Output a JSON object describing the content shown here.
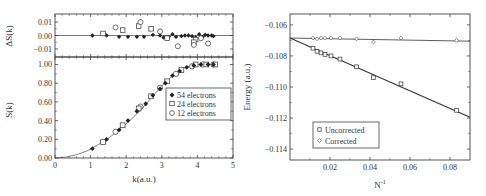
{
  "chart_data": [
    {
      "id": "left",
      "type": "scatter",
      "panels": [
        {
          "id": "delta",
          "ylabel": "ΔS(k)",
          "ylim": [
            -0.016,
            0.016
          ],
          "yticks": [
            0.01,
            0.0,
            -0.01
          ],
          "ytick_labels": [
            "0.01",
            "0.00",
            "-0.01"
          ],
          "reference_line": 0.0,
          "series": [
            {
              "name": "54 electrons",
              "marker": "filled-diamond",
              "x": [
                1.05,
                1.45,
                1.8,
                2.05,
                2.3,
                2.5,
                2.75,
                2.95,
                3.05,
                3.2,
                3.3,
                3.4,
                3.55,
                3.65,
                3.75,
                3.85,
                3.95,
                4.05,
                4.15,
                4.22,
                4.3,
                4.4,
                4.45
              ],
              "y": [
                0.0,
                0.0,
                -0.001,
                -0.001,
                -0.001,
                -0.001,
                0.0005,
                0.0,
                -0.0015,
                -0.001,
                0.001,
                -0.001,
                -0.0005,
                0.0,
                0.0,
                -0.0005,
                -0.0015,
                0.001,
                -0.001,
                0.0005,
                0.0,
                0.0,
                -0.0005
              ]
            },
            {
              "name": "24 electrons",
              "marker": "open-square",
              "x": [
                1.35,
                1.9,
                2.35,
                2.7,
                3.15,
                3.95,
                3.9
              ],
              "y": [
                0.0015,
                0.004,
                0.007,
                0.005,
                -0.002,
                -0.003,
                -0.005
              ]
            },
            {
              "name": "12 electrons",
              "marker": "open-circle",
              "x": [
                1.7,
                2.4,
                2.95,
                3.45,
                3.9,
                4.1,
                4.3
              ],
              "y": [
                0.006,
                0.01,
                0.003,
                -0.008,
                -0.007,
                -0.002,
                -0.006
              ]
            }
          ]
        },
        {
          "id": "main",
          "xlabel": "k(a.u.)",
          "ylabel": "S(k)",
          "xlim": [
            0,
            5
          ],
          "ylim": [
            0,
            1.08
          ],
          "xticks": [
            0,
            1,
            2,
            3,
            4,
            5
          ],
          "xtick_labels": [
            "0",
            "1",
            "2",
            "3",
            "4",
            "5"
          ],
          "yticks": [
            0.0,
            0.2,
            0.4,
            0.6,
            0.8,
            1.0
          ],
          "ytick_labels": [
            "0.00",
            "0.20",
            "0.40",
            "0.60",
            "0.80",
            "1.00"
          ],
          "curve": {
            "name": "fit",
            "x": [
              0,
              0.3,
              0.6,
              0.9,
              1.2,
              1.5,
              1.8,
              2.1,
              2.4,
              2.7,
              3.0,
              3.3,
              3.6,
              3.9,
              4.2,
              4.5
            ],
            "y": [
              0,
              0.01,
              0.035,
              0.075,
              0.14,
              0.21,
              0.3,
              0.4,
              0.51,
              0.64,
              0.77,
              0.88,
              0.96,
              0.995,
              1.0,
              1.0
            ]
          },
          "series": [
            {
              "name": "54 electrons",
              "marker": "filled-diamond",
              "x": [
                1.05,
                1.45,
                1.8,
                2.05,
                2.3,
                2.55,
                2.75,
                2.95,
                3.1,
                3.3,
                3.5,
                3.7,
                3.9,
                4.1,
                4.3,
                4.45
              ],
              "y": [
                0.1,
                0.2,
                0.3,
                0.4,
                0.5,
                0.58,
                0.67,
                0.74,
                0.8,
                0.88,
                0.93,
                0.97,
                0.99,
                1.0,
                1.0,
                1.0
              ]
            },
            {
              "name": "24 electrons",
              "marker": "open-square",
              "x": [
                1.35,
                1.9,
                2.35,
                2.7,
                3.15,
                3.55,
                3.95,
                4.25,
                4.5
              ],
              "y": [
                0.17,
                0.35,
                0.53,
                0.66,
                0.82,
                0.94,
                1.0,
                1.0,
                1.0
              ]
            },
            {
              "name": "12 electrons",
              "marker": "open-circle",
              "x": [
                1.7,
                2.4,
                2.95,
                3.4,
                3.85,
                4.15,
                4.45
              ],
              "y": [
                0.28,
                0.55,
                0.75,
                0.9,
                0.98,
                1.0,
                1.0
              ]
            }
          ],
          "legend": {
            "position": "lower right",
            "entries": [
              "54 electrons",
              "24 electrons",
              "12 electrons"
            ]
          }
        }
      ]
    },
    {
      "id": "right",
      "type": "scatter",
      "xlabel": "N⁻¹",
      "ylabel": "Energy (a.u.)",
      "xlim": [
        0,
        0.09
      ],
      "ylim": [
        -0.1147,
        -0.1053
      ],
      "xticks": [
        0.02,
        0.04,
        0.06,
        0.08
      ],
      "xtick_labels": [
        "0.02",
        "0.04",
        "0.06",
        "0.08"
      ],
      "yticks": [
        -0.106,
        -0.108,
        -0.11,
        -0.112,
        -0.114
      ],
      "ytick_labels": [
        "-0.106",
        "-0.108",
        "-0.110",
        "-0.112",
        "-0.114"
      ],
      "series": [
        {
          "name": "Uncorrected",
          "marker": "open-square",
          "x": [
            0.0115,
            0.0135,
            0.0155,
            0.0175,
            0.0205,
            0.025,
            0.0333,
            0.0417,
            0.0555,
            0.0833
          ],
          "y": [
            -0.1075,
            -0.1077,
            -0.1078,
            -0.1079,
            -0.108,
            -0.1082,
            -0.1087,
            -0.1094,
            -0.1098,
            -0.1115
          ],
          "fit": {
            "x": [
              0,
              0.09
            ],
            "y": [
              -0.10685,
              -0.11195
            ]
          }
        },
        {
          "name": "Corrected",
          "marker": "open-diamond",
          "x": [
            0.0115,
            0.0135,
            0.0155,
            0.0175,
            0.0205,
            0.025,
            0.0333,
            0.0417,
            0.0555,
            0.0833
          ],
          "y": [
            -0.10685,
            -0.1069,
            -0.10685,
            -0.10685,
            -0.10685,
            -0.10685,
            -0.1069,
            -0.1071,
            -0.10685,
            -0.107
          ],
          "fit": {
            "x": [
              0,
              0.09
            ],
            "y": [
              -0.10685,
              -0.10705
            ]
          }
        }
      ],
      "legend": {
        "position": "lower left",
        "entries": [
          "Uncorrected",
          "Corrected"
        ]
      }
    }
  ],
  "labels": {
    "left_delta_ylabel": "ΔS(k)",
    "left_main_ylabel": "S(k)",
    "left_xlabel": "k(a.u.)",
    "right_ylabel": "Energy (a.u.)",
    "right_xlabel": "N",
    "right_xlabel_sup": "-1",
    "legend_left": [
      "54 electrons",
      "24 electrons",
      "12 electrons"
    ],
    "legend_right": [
      "Uncorrected",
      "Corrected"
    ]
  },
  "colors": {
    "ink": "#333333",
    "frame": "#555555",
    "background": "#ffffff"
  }
}
